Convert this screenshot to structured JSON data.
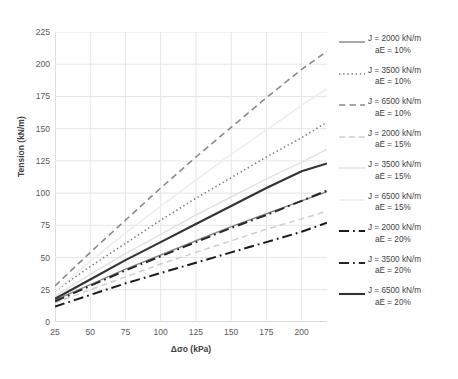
{
  "artifacts": {
    "top": "......   ........",
    "bottom": "...   ....  ...   .. ..."
  },
  "chart_data": {
    "type": "line",
    "title": "",
    "xlabel": "Δσo (kPa)",
    "ylabel": "Tension (kN/m)",
    "xlim": [
      25,
      218
    ],
    "ylim": [
      0,
      225
    ],
    "xticks": [
      25,
      50,
      75,
      100,
      125,
      150,
      175,
      200
    ],
    "yticks": [
      0,
      25,
      50,
      75,
      100,
      125,
      150,
      175,
      200,
      225
    ],
    "grid": true,
    "legend_position": "right",
    "x": [
      25,
      50,
      75,
      100,
      125,
      150,
      175,
      200,
      218
    ],
    "series": [
      {
        "name": "J = 2000 kN/m aE = 10%",
        "label_line1": "J = 2000 kN/m",
        "label_line2": "aE = 10%",
        "color": "#8c8c8c",
        "width": 1.5,
        "dash": "none",
        "values": [
          17,
          29,
          41,
          52,
          63,
          74,
          84,
          94,
          101
        ]
      },
      {
        "name": "J = 3500 kN/m aE = 10%",
        "label_line1": "J = 3500 kN/m",
        "label_line2": "aE = 10%",
        "color": "#808080",
        "width": 1.6,
        "dash": "dotted",
        "values": [
          24,
          43,
          61,
          79,
          96,
          112,
          128,
          143,
          155
        ]
      },
      {
        "name": "J = 6500 kN/m aE = 10%",
        "label_line1": "J = 6500 kN/m",
        "label_line2": "aE = 10%",
        "color": "#8a8a8a",
        "width": 1.6,
        "dash": "dashed",
        "values": [
          28,
          54,
          79,
          104,
          128,
          151,
          174,
          196,
          210
        ]
      },
      {
        "name": "J = 2000 kN/m aE = 15%",
        "label_line1": "J = 2000 kN/m",
        "label_line2": "aE = 15%",
        "color": "#cfcfcf",
        "width": 1.5,
        "dash": "dashed",
        "values": [
          15,
          25,
          35,
          45,
          54,
          63,
          72,
          80,
          86
        ]
      },
      {
        "name": "J = 3500 kN/m aE = 15%",
        "label_line1": "J = 3500 kN/m",
        "label_line2": "aE = 15%",
        "color": "#e2e2e2",
        "width": 1.5,
        "dash": "none",
        "values": [
          20,
          37,
          53,
          68,
          83,
          97,
          111,
          124,
          134
        ]
      },
      {
        "name": "J = 6500 kN/m aE = 15%",
        "label_line1": "J = 6500 kN/m",
        "label_line2": "aE = 15%",
        "color": "#ededed",
        "width": 1.5,
        "dash": "none",
        "values": [
          24,
          47,
          69,
          90,
          110,
          130,
          149,
          168,
          181
        ]
      },
      {
        "name": "J = 2000 kN/m aE = 20%",
        "label_line1": "J = 2000 kN/m",
        "label_line2": "aE = 20%",
        "color": "#1a1a1a",
        "width": 2.0,
        "dash": "dashdot",
        "values": [
          12,
          21,
          30,
          38,
          46,
          54,
          62,
          70,
          77
        ]
      },
      {
        "name": "J = 3500 kN/m aE = 20%",
        "label_line1": "J = 3500 kN/m",
        "label_line2": "aE = 20%",
        "color": "#262626",
        "width": 2.0,
        "dash": "dashdot",
        "values": [
          16,
          28,
          40,
          51,
          62,
          73,
          83,
          94,
          102
        ]
      },
      {
        "name": "J = 6500 kN/m aE = 20%",
        "label_line1": "J = 6500 kN/m",
        "label_line2": "aE = 20%",
        "color": "#333333",
        "width": 2.1,
        "dash": "none",
        "values": [
          18,
          33,
          48,
          62,
          76,
          90,
          104,
          117,
          123
        ]
      }
    ]
  }
}
